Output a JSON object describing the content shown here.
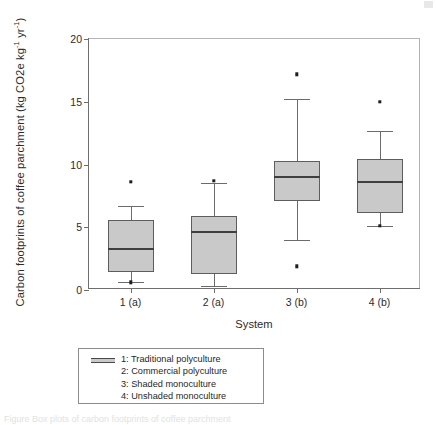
{
  "figure": {
    "caption": "Figure  Box plots of carbon footprints of coffee parchment",
    "corner_mark_name": "page-edge-artifact"
  },
  "chart_data": {
    "type": "box",
    "title": "",
    "xlabel": "System",
    "ylabel": "Carbon footprints of coffee parchment (kg CO2e kg⁻¹ yr⁻¹)",
    "ylabel_parts": {
      "main": "Carbon footprints of coffee parchment (kg CO2e kg",
      "sup1": "-1",
      "mid": " yr",
      "sup2": "-1",
      "tail": ")"
    },
    "ylim": [
      0,
      20
    ],
    "ytick_labels": [
      "0",
      "5",
      "10",
      "15",
      "20"
    ],
    "ytick_values": [
      0,
      5,
      10,
      15,
      20
    ],
    "grid": false,
    "legend_position": "below-axes",
    "categories": [
      "1 (a)",
      "2 (a)",
      "3 (b)",
      "4 (b)"
    ],
    "boxes": [
      {
        "category": "1 (a)",
        "whisker_low": 0.6,
        "q1": 1.4,
        "median": 3.3,
        "q3": 5.6,
        "whisker_high": 6.7,
        "outliers": [
          8.6,
          0.6
        ]
      },
      {
        "category": "2 (a)",
        "whisker_low": 0.3,
        "q1": 1.3,
        "median": 4.6,
        "q3": 5.9,
        "whisker_high": 8.5,
        "outliers": [
          8.7
        ]
      },
      {
        "category": "3 (b)",
        "whisker_low": 4.0,
        "q1": 7.1,
        "median": 9.0,
        "q3": 10.3,
        "whisker_high": 15.2,
        "outliers": [
          17.2,
          1.9
        ]
      },
      {
        "category": "4 (b)",
        "whisker_low": 5.1,
        "q1": 6.1,
        "median": 8.6,
        "q3": 10.4,
        "whisker_high": 12.7,
        "outliers": [
          15.0,
          5.1
        ]
      }
    ],
    "colors": {
      "box_fill": "#c9c9c9",
      "box_edge": "#5d5d5d",
      "median": "#3f3f3f",
      "whisker": "#6b6b6b",
      "outlier": "#1e1e1e",
      "axis": "#6e6e6e",
      "background": "#ffffff"
    }
  },
  "legend": {
    "swatch_name": "box-fill-swatch",
    "entries": [
      "1: Traditional polyculture",
      "2: Commercial polyculture",
      "3: Shaded monoculture",
      "4: Unshaded monoculture"
    ]
  }
}
